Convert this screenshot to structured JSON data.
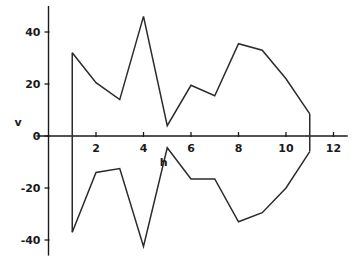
{
  "chart_data": {
    "type": "line",
    "title": "",
    "subtitle": "",
    "xlabel": "h",
    "ylabel": "v",
    "xlim": [
      0,
      12.6
    ],
    "ylim": [
      -46,
      50
    ],
    "xticks": [
      2,
      4,
      6,
      8,
      10,
      12
    ],
    "yticks": [
      40,
      20,
      0,
      -20,
      -40
    ],
    "xtick_labels": [
      "2",
      "4",
      "6",
      "8",
      "10",
      "12"
    ],
    "ytick_labels": [
      "40",
      "20",
      "0",
      "-20",
      "-40"
    ],
    "grid": false,
    "legend": false,
    "legend_position": "none",
    "line_color": "#2b2b2b",
    "axis_color": "#1a1a1a",
    "background_color": "#ffffff",
    "x": [
      1,
      2,
      3,
      4,
      5,
      6,
      7,
      8,
      9,
      10,
      11
    ],
    "series": [
      {
        "name": "upper envelope",
        "values": [
          32,
          20.5,
          14,
          46,
          4,
          19.5,
          15.5,
          35.5,
          33,
          22,
          8.5
        ]
      },
      {
        "name": "lower envelope",
        "values": [
          -37,
          -14,
          -12.5,
          -42.5,
          -4.5,
          -16.5,
          -16.5,
          -33,
          -29.5,
          -20,
          -6
        ]
      }
    ],
    "closure_segments": [
      {
        "name": "left-closure",
        "x": 1,
        "y_from": 32,
        "y_to": -37
      },
      {
        "name": "right-closure",
        "x": 11,
        "y_from": 8.5,
        "y_to": -6
      }
    ]
  }
}
